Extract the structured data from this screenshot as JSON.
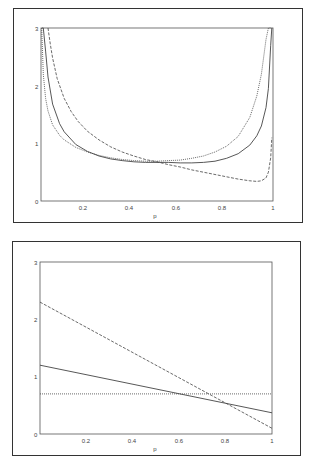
{
  "chart_data": [
    {
      "type": "line",
      "title": "",
      "xlabel": "p",
      "ylabel": "",
      "xlim": [
        0,
        1
      ],
      "ylim": [
        0,
        3
      ],
      "x_ticks": [
        "0.2",
        "0.4",
        "0.6",
        "0.8",
        "1"
      ],
      "y_ticks": [
        "0",
        "1",
        "2",
        "3"
      ],
      "grid": false,
      "legend": "none",
      "series": [
        {
          "name": "solid",
          "style": "solid",
          "x": [
            0.005,
            0.01,
            0.02,
            0.03,
            0.05,
            0.08,
            0.1,
            0.15,
            0.2,
            0.25,
            0.3,
            0.35,
            0.4,
            0.45,
            0.5,
            0.55,
            0.6,
            0.65,
            0.7,
            0.75,
            0.8,
            0.85,
            0.9,
            0.93,
            0.95,
            0.97,
            0.98,
            0.99,
            0.995
          ],
          "y": [
            3.0,
            3.0,
            2.6,
            2.15,
            1.68,
            1.34,
            1.2,
            0.98,
            0.86,
            0.78,
            0.73,
            0.7,
            0.68,
            0.67,
            0.67,
            0.67,
            0.66,
            0.66,
            0.67,
            0.69,
            0.74,
            0.82,
            0.97,
            1.13,
            1.3,
            1.62,
            1.95,
            2.7,
            3.0
          ]
        },
        {
          "name": "dashed",
          "style": "dashed",
          "x": [
            0.03,
            0.04,
            0.05,
            0.07,
            0.1,
            0.13,
            0.16,
            0.2,
            0.25,
            0.3,
            0.35,
            0.4,
            0.45,
            0.5,
            0.55,
            0.6,
            0.65,
            0.7,
            0.75,
            0.8,
            0.85,
            0.9,
            0.93,
            0.95,
            0.97,
            0.98,
            0.99,
            0.995
          ],
          "y": [
            3.0,
            2.72,
            2.48,
            2.12,
            1.78,
            1.55,
            1.38,
            1.21,
            1.06,
            0.94,
            0.85,
            0.78,
            0.72,
            0.68,
            0.63,
            0.59,
            0.54,
            0.5,
            0.46,
            0.42,
            0.38,
            0.35,
            0.34,
            0.35,
            0.4,
            0.5,
            0.75,
            1.1
          ]
        },
        {
          "name": "dotted",
          "style": "dotted",
          "x": [
            0.003,
            0.01,
            0.02,
            0.03,
            0.05,
            0.08,
            0.1,
            0.15,
            0.2,
            0.25,
            0.3,
            0.35,
            0.4,
            0.45,
            0.5,
            0.55,
            0.6,
            0.65,
            0.7,
            0.75,
            0.8,
            0.85,
            0.9,
            0.93,
            0.95,
            0.97,
            0.98,
            0.99
          ],
          "y": [
            3.0,
            2.2,
            1.78,
            1.56,
            1.32,
            1.14,
            1.06,
            0.93,
            0.85,
            0.79,
            0.75,
            0.72,
            0.7,
            0.69,
            0.69,
            0.7,
            0.71,
            0.74,
            0.78,
            0.85,
            0.95,
            1.12,
            1.45,
            1.82,
            2.2,
            2.8,
            3.0,
            3.0
          ]
        }
      ]
    },
    {
      "type": "line",
      "title": "",
      "xlabel": "p",
      "ylabel": "",
      "xlim": [
        0,
        1
      ],
      "ylim": [
        0,
        3
      ],
      "x_ticks": [
        "0.2",
        "0.4",
        "0.6",
        "0.8",
        "1"
      ],
      "y_ticks": [
        "0",
        "1",
        "2",
        "3"
      ],
      "grid": false,
      "legend": "none",
      "series": [
        {
          "name": "solid",
          "style": "solid",
          "x": [
            0,
            1
          ],
          "y": [
            1.2,
            0.37
          ]
        },
        {
          "name": "dashed",
          "style": "dashed",
          "x": [
            0,
            1
          ],
          "y": [
            2.3,
            0.1
          ]
        },
        {
          "name": "dotted",
          "style": "dotted",
          "x": [
            0,
            1
          ],
          "y": [
            0.7,
            0.7
          ]
        }
      ]
    }
  ]
}
